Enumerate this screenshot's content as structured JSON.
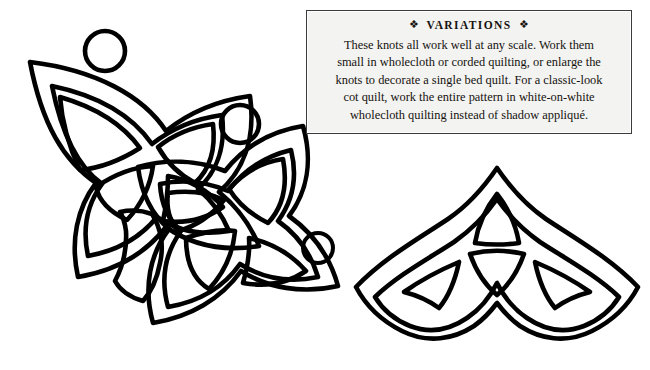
{
  "page": {
    "background_color": "#ffffff",
    "ink_color": "#000000",
    "width": 650,
    "height": 370
  },
  "variations": {
    "title": "VARIATIONS",
    "title_ornament_left": "❖",
    "title_ornament_right": "❖",
    "box_background_color": "#f3f3f1",
    "box_border_color": "#3a3a3a",
    "body_lines": [
      "These knots all work well at any scale. Work them",
      "small in wholecloth or corded quilting, or enlarge the",
      "knots to decorate a single bed quilt. For a classic-look",
      "cot quilt, work the entire pattern in white-on-white",
      "wholecloth quilting instead of shadow appliqué."
    ],
    "body_text": "These knots all work well at any scale. Work them small in wholecloth or corded quilting, or enlarge the knots to decorate a single bed quilt. For a classic-look cot quilt, work the entire pattern in white-on-white wholecloth quilting instead of shadow appliqué."
  },
  "artwork": {
    "title": "Celtic knot quilting templates",
    "stroke_color": "#000000",
    "stroke_width": 4.6,
    "fill_color": "#ffffff",
    "elements": [
      {
        "name": "quaternary-knot-left",
        "label": "Interlaced double quaternary Celtic knot"
      },
      {
        "name": "triquetra-knot-right",
        "label": "Triquetra (trinity) Celtic knot"
      },
      {
        "name": "circle-top-left",
        "label": "Small circle motif",
        "cx": 105,
        "cy": 51,
        "r": 20
      },
      {
        "name": "circle-upper-middle",
        "label": "Small circle motif",
        "cx": 240,
        "cy": 124,
        "r": 19
      },
      {
        "name": "circle-center-small",
        "label": "Small circle motif",
        "cx": 318,
        "cy": 248,
        "r": 15
      }
    ]
  }
}
